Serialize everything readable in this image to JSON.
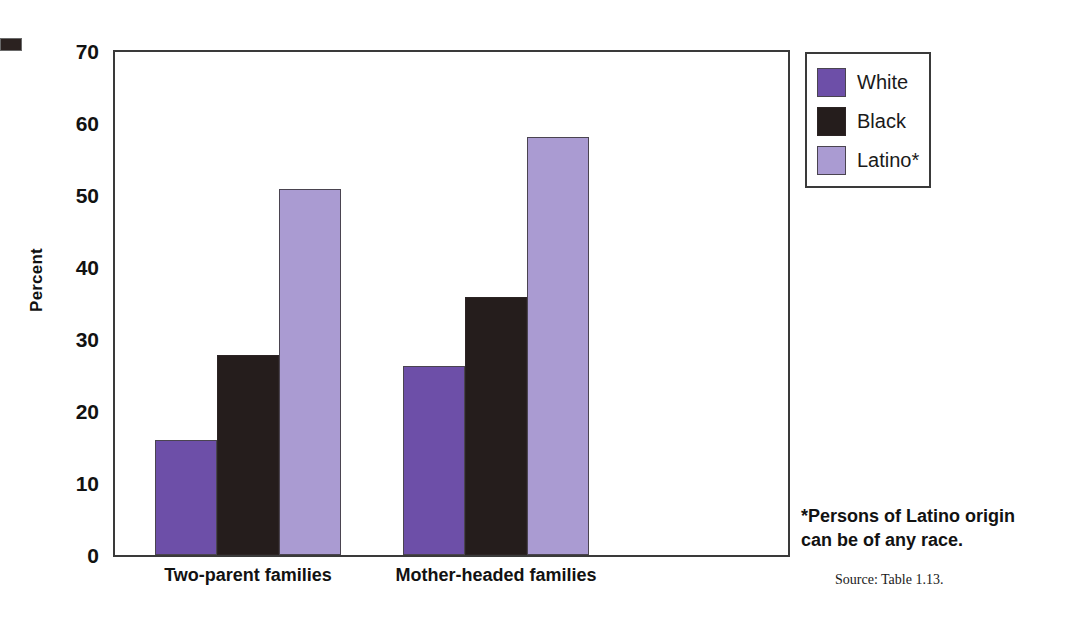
{
  "chart_data": {
    "type": "bar",
    "title": "",
    "xlabel": "",
    "ylabel": "Percent",
    "ylim": [
      0,
      70
    ],
    "ytick_values": [
      0,
      10,
      20,
      30,
      40,
      50,
      60,
      70
    ],
    "ytick_labels": [
      "0",
      "10",
      "20",
      "30",
      "40",
      "50",
      "60",
      "70"
    ],
    "grid": false,
    "legend_position": "top-right",
    "categories": [
      "Two-parent families",
      "Mother-headed families"
    ],
    "series": [
      {
        "name": "White",
        "color": "#6d4fa8",
        "values": [
          16.0,
          26.2
        ]
      },
      {
        "name": "Black",
        "color": "#251d1c",
        "values": [
          27.8,
          35.8
        ]
      },
      {
        "name": "Latino*",
        "color": "#aa9bd2",
        "values": [
          50.8,
          58.0
        ]
      }
    ],
    "footnote": "*Persons of Latino origin can be of any race.",
    "source": "Source: Table 1.13."
  },
  "axis": {
    "y_title": "Percent",
    "ticks": [
      {
        "label": "70",
        "value": 70
      },
      {
        "label": "60",
        "value": 60
      },
      {
        "label": "50",
        "value": 50
      },
      {
        "label": "40",
        "value": 40
      },
      {
        "label": "30",
        "value": 30
      },
      {
        "label": "20",
        "value": 20
      },
      {
        "label": "10",
        "value": 10
      },
      {
        "label": "0",
        "value": 0
      }
    ]
  },
  "groups": [
    {
      "label": "Two-parent families"
    },
    {
      "label": "Mother-headed families"
    }
  ],
  "legend": {
    "entries": [
      {
        "label": "White",
        "color": "#6d4fa8"
      },
      {
        "label": "Black",
        "color": "#251d1c"
      },
      {
        "label": "Latino*",
        "color": "#aa9bd2"
      }
    ]
  },
  "notes": {
    "footnote_line1": "*Persons of Latino origin",
    "footnote_line2": "can be of any race.",
    "source": "Source: Table 1.13."
  }
}
